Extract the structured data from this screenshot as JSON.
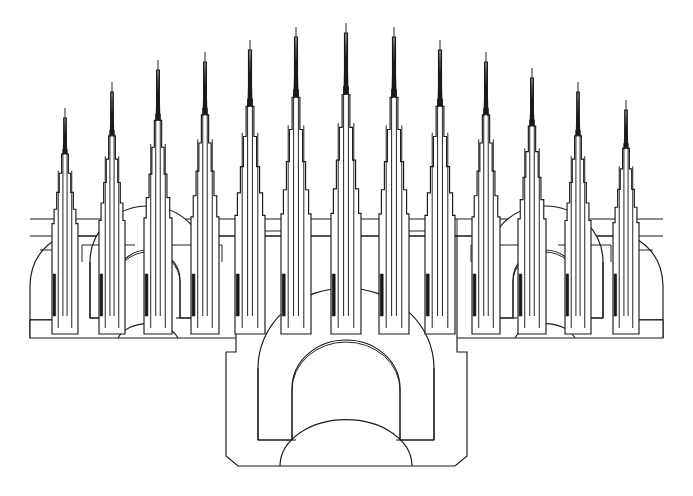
{
  "document": {
    "title": "Gothic Cathedral Facade Line Drawing",
    "subject": "cathedral-elevation",
    "style": "black-and-white line art",
    "background_color": "#ffffff",
    "ink_color": "#1a1a1a",
    "width": 693,
    "height": 496
  },
  "figure": {
    "spire_count": 13,
    "portal_count": 3,
    "symmetry": "bilateral about vertical center line at x=346"
  },
  "geometry": {
    "center_x": 346.5,
    "cornice": {
      "label": "cornice-band",
      "top_y": 219,
      "bottom_y": 236,
      "left_x": 30,
      "right_x": 663
    },
    "wing_base_y": 338,
    "center_base_y": 466,
    "spires": [
      {
        "id": 1,
        "tip_x": 65,
        "tip_y": 118,
        "base_half_width": 13,
        "shoulder_y": 238
      },
      {
        "id": 2,
        "tip_x": 112,
        "tip_y": 92,
        "base_half_width": 13,
        "shoulder_y": 238
      },
      {
        "id": 3,
        "tip_x": 158,
        "tip_y": 70,
        "base_half_width": 14,
        "shoulder_y": 238
      },
      {
        "id": 4,
        "tip_x": 205,
        "tip_y": 62,
        "base_half_width": 14,
        "shoulder_y": 238
      },
      {
        "id": 5,
        "tip_x": 250,
        "tip_y": 50,
        "base_half_width": 15,
        "shoulder_y": 238
      },
      {
        "id": 6,
        "tip_x": 296,
        "tip_y": 37,
        "base_half_width": 15,
        "shoulder_y": 238
      },
      {
        "id": 7,
        "tip_x": 346,
        "tip_y": 33,
        "base_half_width": 15,
        "shoulder_y": 238
      },
      {
        "id": 8,
        "tip_x": 394,
        "tip_y": 37,
        "base_half_width": 15,
        "shoulder_y": 238
      },
      {
        "id": 9,
        "tip_x": 440,
        "tip_y": 50,
        "base_half_width": 15,
        "shoulder_y": 238
      },
      {
        "id": 10,
        "tip_x": 486,
        "tip_y": 62,
        "base_half_width": 14,
        "shoulder_y": 238
      },
      {
        "id": 11,
        "tip_x": 532,
        "tip_y": 78,
        "base_half_width": 14,
        "shoulder_y": 238
      },
      {
        "id": 12,
        "tip_x": 578,
        "tip_y": 92,
        "base_half_width": 13,
        "shoulder_y": 238
      },
      {
        "id": 13,
        "tip_x": 626,
        "tip_y": 110,
        "base_half_width": 13,
        "shoulder_y": 238
      }
    ],
    "portals": [
      {
        "id": "left-portal",
        "center_x": 148,
        "outer_arch_radius": 58,
        "inner_arch_radius": 37,
        "springing_y": 318,
        "base_y": 338
      },
      {
        "id": "center-portal",
        "center_x": 346,
        "outer_arch_radius": 88,
        "inner_arch_radius": 60,
        "springing_y": 440,
        "base_y": 466
      },
      {
        "id": "right-portal",
        "center_x": 545,
        "outer_arch_radius": 58,
        "inner_arch_radius": 37,
        "springing_y": 318,
        "base_y": 338
      }
    ]
  },
  "legend": {
    "spire_label": "needle spire",
    "portal_label": "arched portal",
    "cornice_label": "cornice band",
    "buttress_label": "buttress block"
  }
}
